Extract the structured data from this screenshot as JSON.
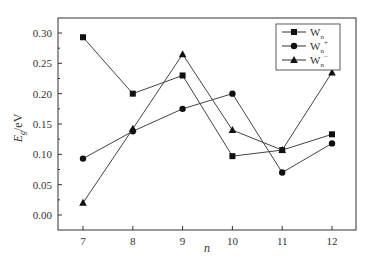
{
  "chart_data": {
    "type": "line",
    "title": "",
    "xlabel": "n",
    "ylabel": "E_g/eV",
    "ylabel_parts": {
      "main": "E",
      "sub": "g",
      "unit": "/eV"
    },
    "x": [
      7,
      8,
      9,
      10,
      11,
      12
    ],
    "x_tick_labels": [
      "7",
      "8",
      "9",
      "10",
      "11",
      "12"
    ],
    "y_tick_labels": [
      "0.00",
      "0.05",
      "0.10",
      "0.15",
      "0.20",
      "0.25",
      "0.30"
    ],
    "y_ticks": [
      0.0,
      0.05,
      0.1,
      0.15,
      0.2,
      0.25,
      0.3
    ],
    "xlim": [
      6.5,
      12.5
    ],
    "ylim": [
      -0.025,
      0.325
    ],
    "grid": false,
    "legend_position": "upper right",
    "series": [
      {
        "name": "Wn",
        "label_main": "W",
        "label_sub": "n",
        "label_sup": "",
        "marker": "square",
        "values": [
          0.293,
          0.2,
          0.23,
          0.097,
          0.107,
          0.133
        ]
      },
      {
        "name": "Wn+",
        "label_main": "W",
        "label_sub": "n",
        "label_sup": "+",
        "marker": "circle",
        "values": [
          0.093,
          0.138,
          0.175,
          0.2,
          0.07,
          0.118
        ]
      },
      {
        "name": "Wn-",
        "label_main": "W",
        "label_sub": "n",
        "label_sup": "−",
        "marker": "triangle",
        "values": [
          0.02,
          0.142,
          0.265,
          0.14,
          0.107,
          0.235
        ]
      }
    ]
  }
}
